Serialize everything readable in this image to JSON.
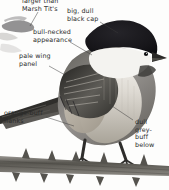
{
  "plate": {
    "kind": "field-guide-illustration",
    "subject": "willow-tit",
    "background_color": "#fdfdfc",
    "ink_color": "#2b2b2b",
    "palette": {
      "cap_black": "#17161a",
      "cheek_white": "#f4f3f0",
      "upperpart_grey": "#8c8a86",
      "wing_dark": "#3a3935",
      "flank_buff": "#b9b2a6",
      "underpart_buff": "#ded9cf",
      "branch_grey": "#6f6d68",
      "leg_dark": "#2e2d2b"
    }
  },
  "labels": [
    {
      "id": "size-comparison",
      "text": "larger than\nMarsh Tit's",
      "x": 22,
      "y": -2
    },
    {
      "id": "black-cap",
      "text": "big, dull\nblack cap",
      "x": 67,
      "y": 8
    },
    {
      "id": "bull-neck",
      "text": "bull-necked\nappearance",
      "x": 33,
      "y": 29
    },
    {
      "id": "wing-panel",
      "text": "pale wing\npanel",
      "x": 19,
      "y": 53
    },
    {
      "id": "orange-buff-flanks",
      "text": "orange-buff\nflanks",
      "x": 4,
      "y": 110
    },
    {
      "id": "grey-buff-below",
      "text": "dull\ngrey-\nbuff\nbelow",
      "x": 135,
      "y": 119
    }
  ],
  "inset": {
    "id": "flight-silhouette",
    "description": "faint flying tit silhouette, top-left corner"
  },
  "main_bird": {
    "id": "perched-willow-tit",
    "description": "perched tit, black cap, white cheek, grey-brown upperparts, buff flanks"
  },
  "perch": {
    "id": "thorny-branch",
    "description": "horizontal thorny branch across lower plate"
  }
}
